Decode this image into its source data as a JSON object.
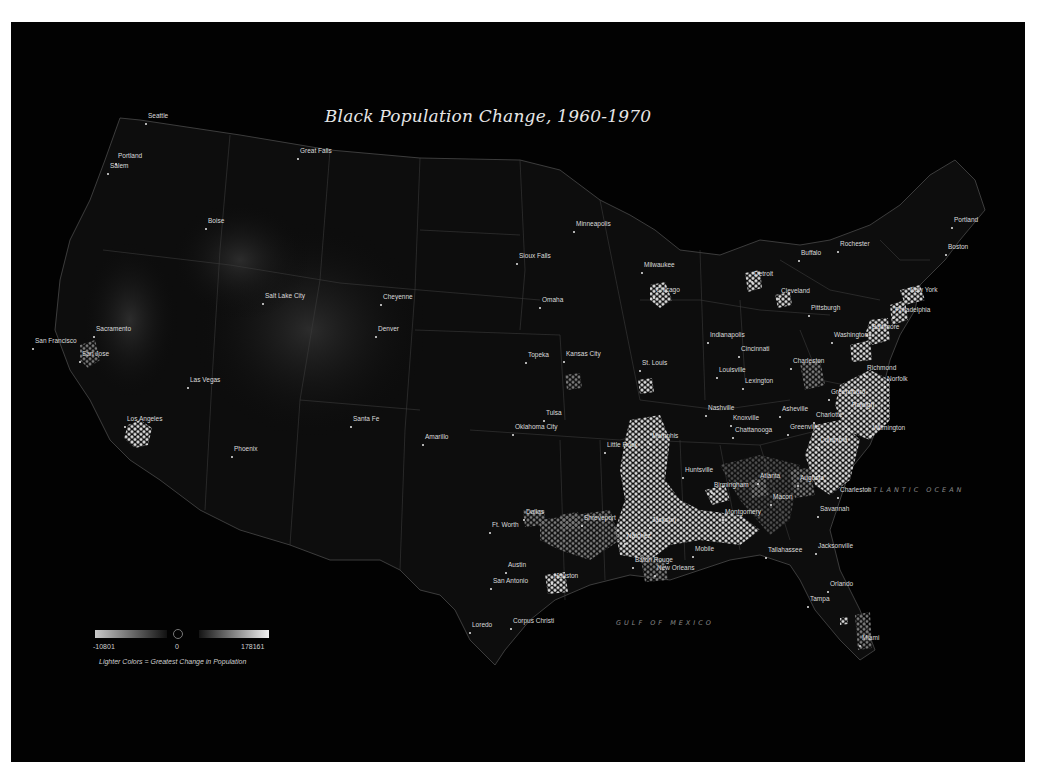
{
  "title": "Black Population Change, 1960-1970",
  "colors": {
    "background": "#020202",
    "page": "#ffffff",
    "label": "#dcdcdc",
    "water_label": "#8a8a8a",
    "state_lines": "#3a3a3a",
    "hex_bright": "#d8d8d8"
  },
  "legend": {
    "min_label": "-10801",
    "zero_label": "0",
    "max_label": "178161",
    "caption": "Lighter Colors = Greatest Change in Population"
  },
  "water_labels": [
    {
      "name": "ATLANTIC OCEAN",
      "x": 866,
      "y": 490
    },
    {
      "name": "GULF OF MEXICO",
      "x": 616,
      "y": 623
    }
  ],
  "cities": [
    {
      "name": "Seattle",
      "x": 148,
      "y": 117,
      "dx": 1,
      "dy": 10
    },
    {
      "name": "Portland",
      "x": 118,
      "y": 157,
      "dx": 3,
      "dy": 11
    },
    {
      "name": "Salem",
      "x": 110,
      "y": 167,
      "dx": 0,
      "dy": 7
    },
    {
      "name": "Great Falls",
      "x": 300,
      "y": 152,
      "dx": 0,
      "dy": 7
    },
    {
      "name": "Boise",
      "x": 208,
      "y": 222,
      "dx": 0,
      "dy": 7
    },
    {
      "name": "Salt Lake City",
      "x": 265,
      "y": 297,
      "dx": 0,
      "dy": 0
    },
    {
      "name": "Sacramento",
      "x": 96,
      "y": 330,
      "dx": 0,
      "dy": 0
    },
    {
      "name": "San Francisco",
      "x": 35,
      "y": 342,
      "dx": 40,
      "dy": 8
    },
    {
      "name": "San Jose",
      "x": 82,
      "y": 355,
      "dx": 0,
      "dy": 0
    },
    {
      "name": "Las Vegas",
      "x": 190,
      "y": 381,
      "dx": 0,
      "dy": 10
    },
    {
      "name": "Los Angeles",
      "x": 127,
      "y": 420,
      "dx": 0,
      "dy": 0
    },
    {
      "name": "Phoenix",
      "x": 234,
      "y": 450,
      "dx": 0,
      "dy": 10
    },
    {
      "name": "Cheyenne",
      "x": 383,
      "y": 298,
      "dx": 0,
      "dy": 7
    },
    {
      "name": "Denver",
      "x": 378,
      "y": 330,
      "dx": 0,
      "dy": 0
    },
    {
      "name": "Santa Fe",
      "x": 353,
      "y": 420,
      "dx": 0,
      "dy": 7
    },
    {
      "name": "Amarillo",
      "x": 425,
      "y": 438,
      "dx": 0,
      "dy": 7
    },
    {
      "name": "Minneapolis",
      "x": 576,
      "y": 225,
      "dx": 0,
      "dy": 7
    },
    {
      "name": "Sioux Falls",
      "x": 519,
      "y": 257,
      "dx": 0,
      "dy": 7
    },
    {
      "name": "Omaha",
      "x": 542,
      "y": 301,
      "dx": 0,
      "dy": 0
    },
    {
      "name": "Topeka",
      "x": 528,
      "y": 356,
      "dx": 0,
      "dy": 7
    },
    {
      "name": "Kansas City",
      "x": 566,
      "y": 355,
      "dx": 0,
      "dy": 0
    },
    {
      "name": "Tulsa",
      "x": 546,
      "y": 414,
      "dx": 0,
      "dy": 0
    },
    {
      "name": "Oklahoma City",
      "x": 515,
      "y": 428,
      "dx": 0,
      "dy": 0
    },
    {
      "name": "St. Louis",
      "x": 642,
      "y": 364,
      "dx": 0,
      "dy": 0
    },
    {
      "name": "Milwaukee",
      "x": 644,
      "y": 266,
      "dx": 0,
      "dy": 0
    },
    {
      "name": "Chicago",
      "x": 656,
      "y": 291,
      "dx": 0,
      "dy": 0
    },
    {
      "name": "Detroit",
      "x": 754,
      "y": 275,
      "dx": 0,
      "dy": 0
    },
    {
      "name": "Cleveland",
      "x": 781,
      "y": 292,
      "dx": 0,
      "dy": 0
    },
    {
      "name": "Buffalo",
      "x": 801,
      "y": 254,
      "dx": 0,
      "dy": 0
    },
    {
      "name": "Rochester",
      "x": 840,
      "y": 245,
      "dx": 0,
      "dy": 0
    },
    {
      "name": "Pittsburgh",
      "x": 811,
      "y": 309,
      "dx": 0,
      "dy": 0
    },
    {
      "name": "Indianapolis",
      "x": 710,
      "y": 336,
      "dx": 0,
      "dy": 0
    },
    {
      "name": "Cincinnati",
      "x": 741,
      "y": 350,
      "dx": 0,
      "dy": 0
    },
    {
      "name": "Louisville",
      "x": 719,
      "y": 371,
      "dx": 0,
      "dy": 0
    },
    {
      "name": "Lexington",
      "x": 745,
      "y": 382,
      "dx": 0,
      "dy": 0
    },
    {
      "name": "Charleston",
      "x": 793,
      "y": 362,
      "dx": 0,
      "dy": 0
    },
    {
      "name": "Washington",
      "x": 834,
      "y": 336,
      "dx": 0,
      "dy": 0
    },
    {
      "name": "Baltimore",
      "x": 872,
      "y": 328,
      "dx": 0,
      "dy": 0
    },
    {
      "name": "Philadelphia",
      "x": 895,
      "y": 311,
      "dx": 0,
      "dy": 0
    },
    {
      "name": "New York",
      "x": 910,
      "y": 291,
      "dx": 0,
      "dy": 0
    },
    {
      "name": "Boston",
      "x": 948,
      "y": 248,
      "dx": 0,
      "dy": 0
    },
    {
      "name": "Portland",
      "x": 954,
      "y": 221,
      "dx": 0,
      "dy": 0
    },
    {
      "name": "Richmond",
      "x": 867,
      "y": 369,
      "dx": 0,
      "dy": 0
    },
    {
      "name": "Norfolk",
      "x": 887,
      "y": 380,
      "dx": 0,
      "dy": 0
    },
    {
      "name": "Greensboro",
      "x": 831,
      "y": 393,
      "dx": 0,
      "dy": 0
    },
    {
      "name": "Raleigh",
      "x": 852,
      "y": 406,
      "dx": 0,
      "dy": 0
    },
    {
      "name": "Wilmington",
      "x": 873,
      "y": 429,
      "dx": 0,
      "dy": 0
    },
    {
      "name": "Charlotte",
      "x": 816,
      "y": 416,
      "dx": 0,
      "dy": 0
    },
    {
      "name": "Asheville",
      "x": 782,
      "y": 410,
      "dx": 0,
      "dy": 0
    },
    {
      "name": "Greenville",
      "x": 790,
      "y": 428,
      "dx": 0,
      "dy": 0
    },
    {
      "name": "Columbia",
      "x": 820,
      "y": 441,
      "dx": 0,
      "dy": 0
    },
    {
      "name": "Nashville",
      "x": 708,
      "y": 409,
      "dx": 0,
      "dy": 0
    },
    {
      "name": "Knoxville",
      "x": 733,
      "y": 419,
      "dx": 0,
      "dy": 0
    },
    {
      "name": "Chattanooga",
      "x": 735,
      "y": 431,
      "dx": 0,
      "dy": 0
    },
    {
      "name": "Memphis",
      "x": 652,
      "y": 437,
      "dx": 0,
      "dy": 0
    },
    {
      "name": "Little Rock",
      "x": 607,
      "y": 446,
      "dx": 0,
      "dy": 0
    },
    {
      "name": "Huntsville",
      "x": 685,
      "y": 471,
      "dx": 0,
      "dy": 0
    },
    {
      "name": "Birmingham",
      "x": 714,
      "y": 486,
      "dx": 0,
      "dy": 0
    },
    {
      "name": "Atlanta",
      "x": 760,
      "y": 477,
      "dx": 0,
      "dy": 0
    },
    {
      "name": "Augusta",
      "x": 800,
      "y": 479,
      "dx": 0,
      "dy": 0
    },
    {
      "name": "Macon",
      "x": 773,
      "y": 498,
      "dx": 0,
      "dy": 0
    },
    {
      "name": "Charleston",
      "x": 840,
      "y": 491,
      "dx": 0,
      "dy": 0
    },
    {
      "name": "Savannah",
      "x": 820,
      "y": 510,
      "dx": 0,
      "dy": 0
    },
    {
      "name": "Montgomery",
      "x": 725,
      "y": 513,
      "dx": 0,
      "dy": 0
    },
    {
      "name": "Jackson",
      "x": 652,
      "y": 521,
      "dx": 0,
      "dy": 0
    },
    {
      "name": "Shreveport",
      "x": 584,
      "y": 519,
      "dx": 0,
      "dy": 0
    },
    {
      "name": "Natchez",
      "x": 627,
      "y": 537,
      "dx": 0,
      "dy": 0
    },
    {
      "name": "Mobile",
      "x": 695,
      "y": 550,
      "dx": 0,
      "dy": 0
    },
    {
      "name": "Tallahassee",
      "x": 768,
      "y": 551,
      "dx": 0,
      "dy": 0
    },
    {
      "name": "Jacksonville",
      "x": 818,
      "y": 547,
      "dx": 0,
      "dy": 0
    },
    {
      "name": "Baton Rouge",
      "x": 635,
      "y": 561,
      "dx": 0,
      "dy": 0
    },
    {
      "name": "New Orleans",
      "x": 657,
      "y": 569,
      "dx": 0,
      "dy": 0
    },
    {
      "name": "Dallas",
      "x": 526,
      "y": 513,
      "dx": 0,
      "dy": 0
    },
    {
      "name": "Ft. Worth",
      "x": 492,
      "y": 526,
      "dx": 0,
      "dy": 0
    },
    {
      "name": "Austin",
      "x": 508,
      "y": 566,
      "dx": 0,
      "dy": 0
    },
    {
      "name": "San Antonio",
      "x": 493,
      "y": 582,
      "dx": 0,
      "dy": 0
    },
    {
      "name": "Houston",
      "x": 554,
      "y": 577,
      "dx": 0,
      "dy": 0
    },
    {
      "name": "Corpus Christi",
      "x": 513,
      "y": 622,
      "dx": 0,
      "dy": 0
    },
    {
      "name": "Loredo",
      "x": 472,
      "y": 626,
      "dx": 0,
      "dy": 0
    },
    {
      "name": "Orlando",
      "x": 830,
      "y": 585,
      "dx": 0,
      "dy": 0
    },
    {
      "name": "Tampa",
      "x": 810,
      "y": 600,
      "dx": 0,
      "dy": 0
    },
    {
      "name": "Miami",
      "x": 862,
      "y": 639,
      "dx": 0,
      "dy": 0
    }
  ]
}
